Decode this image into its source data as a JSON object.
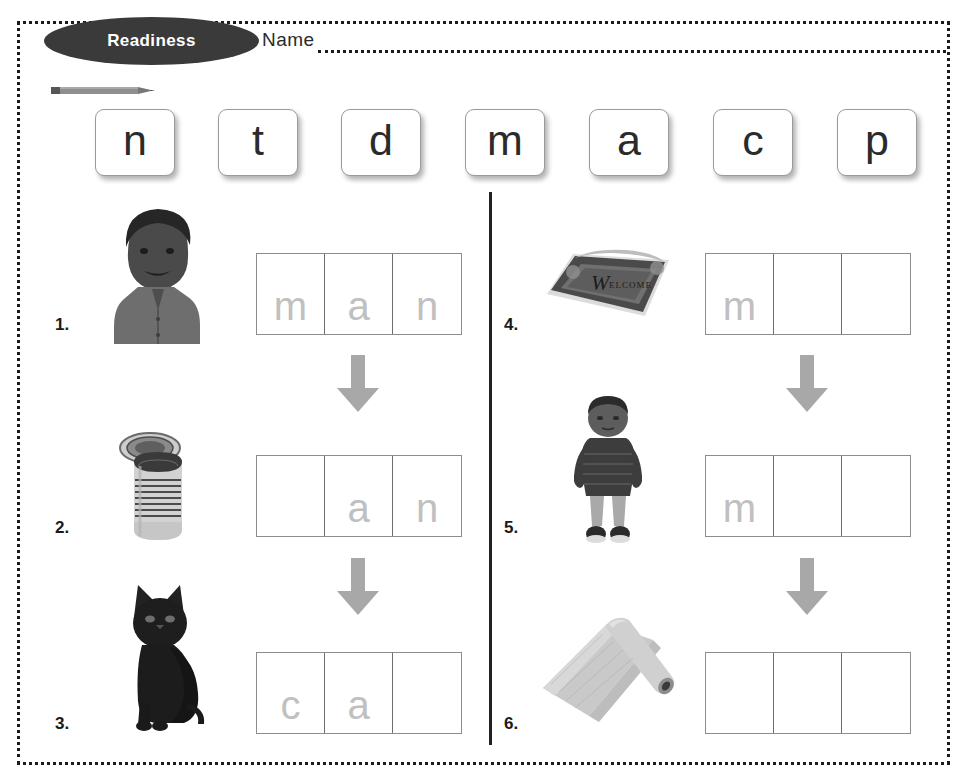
{
  "page": {
    "badge_label": "Readiness",
    "name_label": "Name",
    "pencil_icon": "pencil-icon"
  },
  "letter_bank": {
    "letters": [
      "n",
      "t",
      "d",
      "m",
      "a",
      "c",
      "p"
    ]
  },
  "items": [
    {
      "number": "1.",
      "picture": "man-portrait-photo",
      "cells": [
        "m",
        "a",
        "n"
      ],
      "arrow_after": true
    },
    {
      "number": "2.",
      "picture": "tin-can-photo",
      "cells": [
        "",
        "a",
        "n"
      ],
      "arrow_after": true
    },
    {
      "number": "3.",
      "picture": "black-cat-photo",
      "cells": [
        "c",
        "a",
        ""
      ],
      "arrow_after": false
    },
    {
      "number": "4.",
      "picture": "welcome-mat-photo",
      "cells": [
        "m",
        "",
        ""
      ],
      "arrow_after": true
    },
    {
      "number": "5.",
      "picture": "boy-standing-photo",
      "cells": [
        "m",
        "",
        ""
      ],
      "arrow_after": true
    },
    {
      "number": "6.",
      "picture": "rolled-mat-photo",
      "cells": [
        "",
        "",
        ""
      ],
      "arrow_after": false
    }
  ],
  "colors": {
    "badge_background": "#3a3a3a",
    "badge_text": "#ffffff",
    "border_dots": "#1b1b1b",
    "arrow_fill": "#a8a8a8",
    "cell_letter": "#c0c0c0",
    "grid_line": "#6d6d6d",
    "divider": "#222222"
  }
}
